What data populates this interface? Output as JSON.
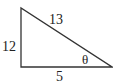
{
  "diagram": {
    "type": "right-triangle",
    "sides": {
      "vertical_leg": "12",
      "hypotenuse": "13",
      "horizontal_leg": "5"
    },
    "angle_label": "θ",
    "line_color": "#333333",
    "text_color": "#222222"
  }
}
